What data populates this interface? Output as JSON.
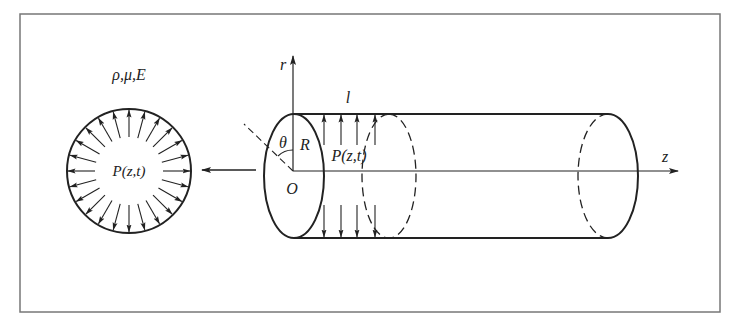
{
  "figure": {
    "frame": {
      "x": 20,
      "y": 14,
      "width": 700,
      "height": 298,
      "stroke": "#777777"
    },
    "cross_section": {
      "material_label": "ρ,μ,E",
      "pressure_label": "P(z,t)",
      "center": [
        129,
        171
      ],
      "radius": 62,
      "arrow_count": 24,
      "arrow_inner_radius": 34
    },
    "cylinder": {
      "axis_r_label": "r",
      "axis_z_label": "z",
      "length_label": "l",
      "radius_label": "R",
      "angle_label": "θ",
      "origin_label": "O",
      "pressure_label": "P(z,t)",
      "front_ellipse": {
        "cx": 294,
        "cy": 176,
        "rx": 30,
        "ry": 62
      },
      "mid_ellipse": {
        "cx": 389,
        "cy": 176,
        "rx": 27,
        "ry": 62
      },
      "back_ellipse": {
        "cx": 608,
        "cy": 176,
        "rx": 30,
        "ry": 62
      },
      "top_y": 114,
      "bottom_y": 238,
      "axis_y": 171,
      "arrow_x": [
        324,
        341,
        357,
        375
      ]
    },
    "section_arrow": {
      "from_x": 256,
      "to_x": 202,
      "y": 170
    }
  }
}
